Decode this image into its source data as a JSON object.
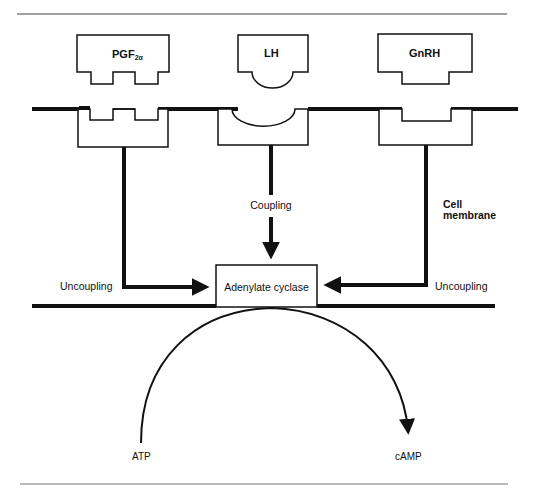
{
  "figure": {
    "ligands": [
      {
        "id": "pgf2a",
        "label": "PGF",
        "subscript": "2α"
      },
      {
        "id": "lh",
        "label": "LH"
      },
      {
        "id": "gnrh",
        "label": "GnRH"
      }
    ],
    "labels": {
      "coupling": "Coupling",
      "uncoupling_left": "Uncoupling",
      "uncoupling_right": "Uncoupling",
      "cell_membrane_line1": "Cell",
      "cell_membrane_line2": "membrane",
      "enzyme": "Adenylate cyclase",
      "substrate": "ATP",
      "product": "cAMP"
    },
    "colors": {
      "ink": "#111111",
      "background": "#ffffff",
      "rule": "#555555"
    }
  }
}
